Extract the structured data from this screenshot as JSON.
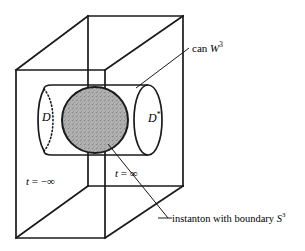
{
  "figure": {
    "background_color": "#ffffff",
    "line_color": "#1a1a1a",
    "shade_color": "#a8a8a8",
    "labels": {
      "can": {
        "text_plain": "can",
        "symbol": "W",
        "exponent": "3",
        "full": "can W3"
      },
      "instanton": {
        "text_plain": "instanton with boundary",
        "symbol": "S",
        "exponent": "3",
        "full": "instanton with boundary S3"
      },
      "t_minus": {
        "variable": "t",
        "equals": "=",
        "value": "−∞",
        "full": "t = −∞"
      },
      "t_plus": {
        "variable": "t",
        "equals": "=",
        "value": "∞",
        "full": "t = ∞"
      },
      "disc_left": {
        "symbol": "D",
        "full": "D"
      },
      "disc_right": {
        "symbol": "D",
        "exponent": "*",
        "full": "D*"
      }
    }
  }
}
